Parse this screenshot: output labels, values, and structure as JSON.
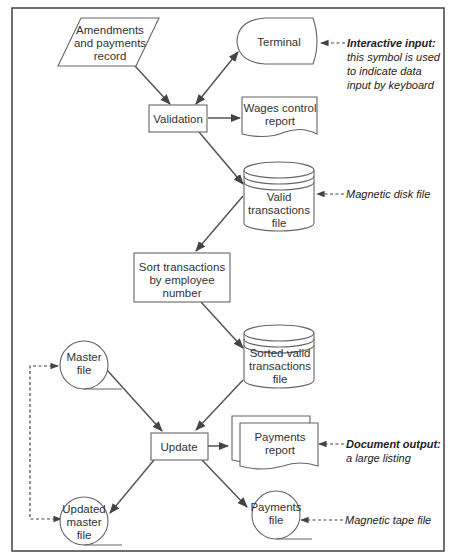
{
  "diagram": {
    "nodes": {
      "amendments": {
        "lines": [
          "Amendments",
          "and payments",
          "record"
        ],
        "shape": "parallelogram"
      },
      "terminal": {
        "lines": [
          "Terminal"
        ],
        "shape": "display-terminal"
      },
      "validation": {
        "lines": [
          "Validation"
        ],
        "shape": "process"
      },
      "wages_report": {
        "lines": [
          "Wages control",
          "report"
        ],
        "shape": "document"
      },
      "valid_file": {
        "lines": [
          "Valid",
          "transactions",
          "file"
        ],
        "shape": "magnetic-disk"
      },
      "sort": {
        "lines": [
          "Sort transactions",
          "by employee",
          "number"
        ],
        "shape": "process"
      },
      "sorted_file": {
        "lines": [
          "Sorted valid",
          "transactions",
          "file"
        ],
        "shape": "magnetic-disk"
      },
      "master_file": {
        "lines": [
          "Master",
          "file"
        ],
        "shape": "magnetic-tape"
      },
      "update": {
        "lines": [
          "Update"
        ],
        "shape": "process"
      },
      "payments_report": {
        "lines": [
          "Payments",
          "report"
        ],
        "shape": "multi-document"
      },
      "updated_master": {
        "lines": [
          "Updated",
          "master",
          "file"
        ],
        "shape": "magnetic-tape"
      },
      "payments_file": {
        "lines": [
          "Payments",
          "file"
        ],
        "shape": "magnetic-tape"
      }
    },
    "annotations": {
      "interactive": {
        "title": "Interactive input:",
        "lines": [
          "this symbol is used",
          "to indicate data",
          "input by keyboard"
        ]
      },
      "disk": {
        "title": "",
        "lines": [
          "Magnetic disk file"
        ]
      },
      "document": {
        "title": "Document output:",
        "lines": [
          "a large listing"
        ]
      },
      "tape": {
        "title": "",
        "lines": [
          "Magnetic tape file"
        ]
      }
    },
    "edges": [
      {
        "from": "amendments",
        "to": "validation"
      },
      {
        "from": "validation",
        "to": "terminal",
        "bidirectional": true
      },
      {
        "from": "validation",
        "to": "wages_report"
      },
      {
        "from": "validation",
        "to": "valid_file"
      },
      {
        "from": "valid_file",
        "to": "sort"
      },
      {
        "from": "sort",
        "to": "sorted_file"
      },
      {
        "from": "sorted_file",
        "to": "update"
      },
      {
        "from": "master_file",
        "to": "update"
      },
      {
        "from": "update",
        "to": "payments_report"
      },
      {
        "from": "update",
        "to": "updated_master"
      },
      {
        "from": "update",
        "to": "payments_file"
      },
      {
        "from": "updated_master",
        "to": "master_file",
        "style": "dashed"
      }
    ]
  }
}
